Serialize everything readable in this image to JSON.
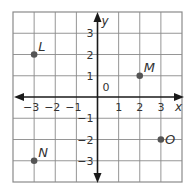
{
  "chart_data": {
    "type": "scatter",
    "title": "",
    "xlabel": "x",
    "ylabel": "y",
    "xlim": [
      -4,
      4
    ],
    "ylim": [
      -4,
      4
    ],
    "grid": true,
    "origin_label": "0",
    "x_ticks": [
      {
        "value": -3,
        "label": "−3"
      },
      {
        "value": -2,
        "label": "−2"
      },
      {
        "value": -1,
        "label": "−1"
      },
      {
        "value": 1,
        "label": "1"
      },
      {
        "value": 2,
        "label": "2"
      },
      {
        "value": 3,
        "label": "3"
      }
    ],
    "y_ticks": [
      {
        "value": 3,
        "label": "3"
      },
      {
        "value": 2,
        "label": "2"
      },
      {
        "value": 1,
        "label": "1"
      },
      {
        "value": -1,
        "label": "−1"
      },
      {
        "value": -2,
        "label": "−2"
      },
      {
        "value": -3,
        "label": "−3"
      }
    ],
    "points": [
      {
        "name": "L",
        "x": -3,
        "y": 2
      },
      {
        "name": "M",
        "x": 2,
        "y": 1
      },
      {
        "name": "N",
        "x": -3,
        "y": -3
      },
      {
        "name": "O",
        "x": 3,
        "y": -2
      }
    ]
  }
}
